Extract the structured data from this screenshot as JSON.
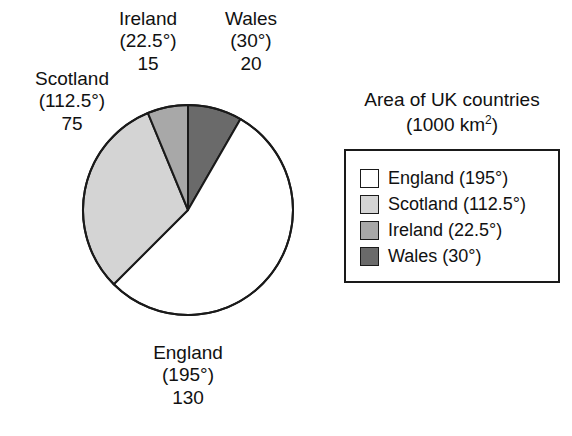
{
  "chart_data": {
    "type": "pie",
    "title": "Area of UK countries",
    "subtitle": "(1000 km2)",
    "units": "1000 km^2",
    "total_value": 240,
    "categories": [
      "England",
      "Scotland",
      "Ireland",
      "Wales"
    ],
    "values": [
      130,
      75,
      15,
      20
    ],
    "angles_deg": [
      195,
      112.5,
      22.5,
      30
    ],
    "colors": [
      "#ffffff",
      "#d4d4d4",
      "#a8a8a8",
      "#6a6a6a"
    ],
    "legend_position": "right",
    "grid": false,
    "start_angle_deg": 0,
    "direction": "clockwise",
    "slice_order_clockwise_from_top": [
      "Wales",
      "England",
      "Scotland",
      "Ireland"
    ],
    "series": [
      {
        "name": "Area of UK countries (1000 km2)",
        "points": [
          {
            "label": "England",
            "value": 130,
            "angle_deg": 195,
            "color": "#ffffff"
          },
          {
            "label": "Scotland",
            "value": 75,
            "angle_deg": 112.5,
            "color": "#d4d4d4"
          },
          {
            "label": "Ireland",
            "value": 15,
            "angle_deg": 22.5,
            "color": "#a8a8a8"
          },
          {
            "label": "Wales",
            "value": 20,
            "angle_deg": 30,
            "color": "#6a6a6a"
          }
        ]
      }
    ]
  },
  "callouts": {
    "ireland": {
      "name": "Ireland",
      "angle": "(22.5°)",
      "value": "15"
    },
    "wales": {
      "name": "Wales",
      "angle": "(30°)",
      "value": "20"
    },
    "scotland": {
      "name": "Scotland",
      "angle": "(112.5°)",
      "value": "75"
    },
    "england": {
      "name": "England",
      "angle": "(195°)",
      "value": "130"
    }
  },
  "legend": {
    "title_line1": "Area of UK countries",
    "title_line2_prefix": "(1000 km",
    "title_line2_sup": "2",
    "title_line2_suffix": ")",
    "items": [
      {
        "label": "England (195°)",
        "color": "#ffffff"
      },
      {
        "label": "Scotland (112.5°)",
        "color": "#d4d4d4"
      },
      {
        "label": "Ireland (22.5°)",
        "color": "#a8a8a8"
      },
      {
        "label": "Wales (30°)",
        "color": "#6a6a6a"
      }
    ]
  },
  "style": {
    "outline_color": "#1a1a1a",
    "text_color": "#111111",
    "background": "#ffffff"
  }
}
